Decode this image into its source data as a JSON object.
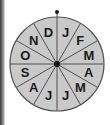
{
  "wheel": {
    "center": [
      57,
      64
    ],
    "radius": 47,
    "sector_count": 12,
    "fill_color": "#c9c9c9",
    "line_color": "#505050",
    "labels_clockwise_from_top": [
      "J",
      "F",
      "M",
      "A",
      "M",
      "J",
      "J",
      "A",
      "S",
      "O",
      "N",
      "D"
    ],
    "pointer": "top-dot"
  }
}
